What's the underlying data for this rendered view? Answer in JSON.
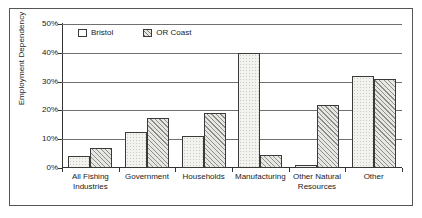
{
  "chart_data": {
    "type": "bar",
    "title": "",
    "xlabel": "",
    "ylabel": "Employment Dependency",
    "categories": [
      "All Fishing Industries",
      "Government",
      "Households",
      "Manufacturing",
      "Other Natural Resources",
      "Other"
    ],
    "category_lines": [
      [
        "All Fishing",
        "Industries"
      ],
      [
        "Government"
      ],
      [
        "Households"
      ],
      [
        "Manufacturing"
      ],
      [
        "Other Natural",
        "Resources"
      ],
      [
        "Other"
      ]
    ],
    "series": [
      {
        "name": "Bristol",
        "values": [
          4,
          12.5,
          11,
          40,
          1,
          32
        ]
      },
      {
        "name": "OR Coast",
        "values": [
          7,
          17.5,
          19,
          4.5,
          22,
          31
        ]
      }
    ],
    "ylim": [
      0,
      50
    ],
    "ytick_labels": [
      "0%",
      "10%",
      "20%",
      "30%",
      "40%",
      "50%"
    ],
    "ytick_values": [
      0,
      10,
      20,
      30,
      40,
      50
    ],
    "grid": true,
    "legend_position": "top-left-inside",
    "colors": {
      "bristol_fill": "#f2f2ef",
      "orcoast_fill": "#e6e6e2",
      "bar_outline": "#3a3a3a",
      "gridline": "#6f6f6f",
      "axis": "#333333",
      "frame": "#555555",
      "text": "#1a1a1a",
      "background": "#ffffff"
    }
  }
}
